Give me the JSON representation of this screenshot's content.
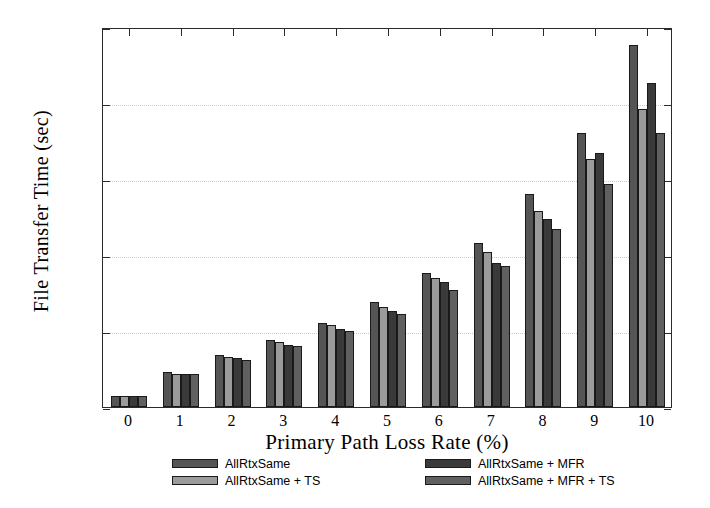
{
  "chart_data": {
    "type": "bar",
    "title": "",
    "xlabel": "Primary Path Loss Rate (%)",
    "ylabel": "File Transfer Time (sec)",
    "categories": [
      "0",
      "1",
      "2",
      "3",
      "4",
      "5",
      "6",
      "7",
      "8",
      "9",
      "10"
    ],
    "xlim": [
      -0.5,
      10.5
    ],
    "ylim": [
      0,
      250
    ],
    "yticks": [
      0,
      50,
      100,
      150,
      200,
      250
    ],
    "ytick_labels": [
      "0",
      "50",
      "100",
      "150",
      "200",
      "250"
    ],
    "grid": true,
    "legend_position": "below-axes",
    "series": [
      {
        "name": "AllRtxSame",
        "color": "#555555",
        "values": [
          7,
          23,
          34,
          44,
          55,
          69,
          88,
          108,
          140,
          180,
          238
        ]
      },
      {
        "name": "AllRtxSame + TS",
        "color": "#9b9b9b",
        "values": [
          7,
          22,
          33,
          43,
          54,
          66,
          85,
          102,
          129,
          163,
          196
        ]
      },
      {
        "name": "AllRtxSame + MFR",
        "color": "#3a3a3a",
        "values": [
          7,
          22,
          32,
          41,
          51,
          63,
          82,
          95,
          124,
          167,
          213
        ]
      },
      {
        "name": "AllRtxSame + MFR + TS",
        "color": "#606060",
        "values": [
          7,
          22,
          31,
          40,
          50,
          61,
          77,
          93,
          117,
          147,
          180
        ]
      }
    ]
  },
  "legend": {
    "items": [
      {
        "label": "AllRtxSame"
      },
      {
        "label": "AllRtxSame + MFR"
      },
      {
        "label": "AllRtxSame + TS"
      },
      {
        "label": "AllRtxSame + MFR + TS"
      }
    ]
  }
}
